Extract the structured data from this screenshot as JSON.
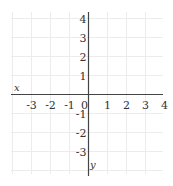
{
  "chart_data": {
    "type": "line",
    "title": "",
    "xlabel": "x",
    "ylabel": "y",
    "xlim": [
      -3.8,
      4.2
    ],
    "ylim": [
      -4.2,
      4.2
    ],
    "grid": true,
    "x_ticks": [
      "-3",
      "-2",
      "-1",
      "0",
      "1",
      "2",
      "3",
      "4"
    ],
    "y_ticks": [
      "4",
      "3",
      "2",
      "1",
      "-1",
      "-2",
      "-3"
    ],
    "series": []
  },
  "colors": {
    "grid": "#ececec",
    "axis": "#444444",
    "text": "#333333"
  }
}
